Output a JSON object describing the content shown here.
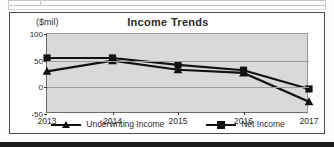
{
  "document": {
    "top_table_fragment": "",
    "footer_rule": ""
  },
  "chart_data": {
    "type": "line",
    "title": "Income Trends",
    "xlabel": "",
    "ylabel": "($mil)",
    "ylim": [
      -50,
      100
    ],
    "yticks": [
      100,
      50,
      0,
      -50
    ],
    "ytick_labels": [
      "100",
      "50",
      "0",
      "-50"
    ],
    "grid": true,
    "legend_position": "bottom",
    "categories": [
      "2013",
      "2014",
      "2015",
      "2016",
      "2017"
    ],
    "series": [
      {
        "name": "Underwriting Income",
        "marker": "triangle",
        "color": "#111111",
        "values": [
          30,
          50,
          33,
          27,
          -27
        ]
      },
      {
        "name": "Net Income",
        "marker": "square",
        "color": "#111111",
        "values": [
          55,
          55,
          42,
          32,
          -3
        ]
      }
    ]
  },
  "legend": {
    "entries": [
      {
        "label": "Underwriting Income",
        "marker": "triangle-marker"
      },
      {
        "label": "Net Income",
        "marker": "square-marker"
      }
    ]
  },
  "colors": {
    "plot_background": "#d9d9d9",
    "frame": "#4a4a4a",
    "series": "#111111",
    "gridline": "#9d9d9d",
    "text": "#2b2b2b"
  }
}
